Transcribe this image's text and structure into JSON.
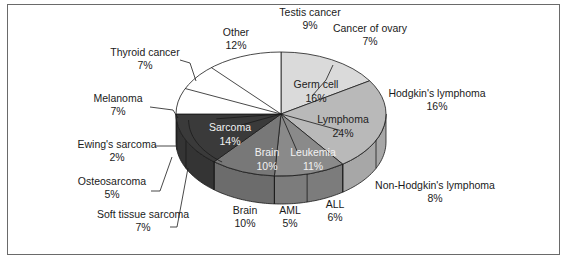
{
  "chart_data": {
    "type": "pie",
    "style": "3d-exploded-nested",
    "title": "",
    "inner_ring": [
      {
        "name": "Germ cell",
        "value": 16,
        "color": "#dadada",
        "text": "dark"
      },
      {
        "name": "Lymphoma",
        "value": 24,
        "color": "#b9b9b9",
        "text": "dark"
      },
      {
        "name": "Leukemia",
        "value": 11,
        "color": "#8a8a8a",
        "text": "light"
      },
      {
        "name": "Brain",
        "value": 10,
        "color": "#787878",
        "text": "light"
      },
      {
        "name": "Sarcoma",
        "value": 14,
        "color": "#3a3a3a",
        "text": "light"
      },
      {
        "name": "",
        "value": 25,
        "color": "#ffffff",
        "text": "dark"
      }
    ],
    "outer_slices": [
      {
        "name": "Testis cancer",
        "value": 9,
        "group": "Germ cell"
      },
      {
        "name": "Cancer of ovary",
        "value": 7,
        "group": "Germ cell"
      },
      {
        "name": "Hodgkin's lymphoma",
        "value": 16,
        "group": "Lymphoma"
      },
      {
        "name": "Non-Hodgkin's lymphoma",
        "value": 8,
        "group": "Lymphoma"
      },
      {
        "name": "ALL",
        "value": 6,
        "group": "Leukemia"
      },
      {
        "name": "AML",
        "value": 5,
        "group": "Leukemia"
      },
      {
        "name": "Brain",
        "value": 10,
        "group": "Brain"
      },
      {
        "name": "Soft tissue sarcoma",
        "value": 7,
        "group": "Sarcoma"
      },
      {
        "name": "Osteosarcoma",
        "value": 5,
        "group": "Sarcoma"
      },
      {
        "name": "Ewing's sarcoma",
        "value": 2,
        "group": "Sarcoma"
      },
      {
        "name": "Melanoma",
        "value": 7,
        "group": "Other"
      },
      {
        "name": "Thyroid cancer",
        "value": 7,
        "group": "Other"
      },
      {
        "name": "Other",
        "value": 12,
        "group": "Other"
      }
    ],
    "units": "%"
  }
}
